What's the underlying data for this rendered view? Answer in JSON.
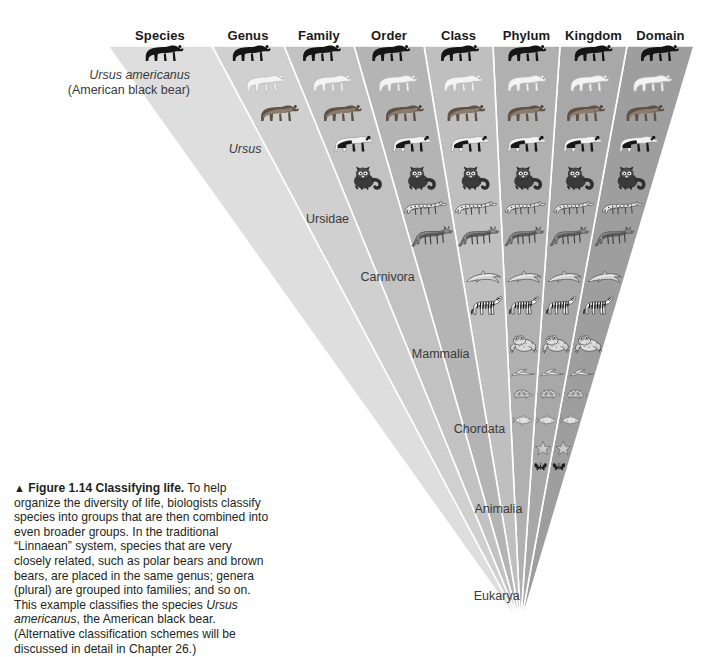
{
  "figure": {
    "marker": "▲",
    "number": "Figure 1.14",
    "title": "Classifying life.",
    "body_1": " To help organize the diversity of life, biologists classify species into groups that are then combined into even broader groups. In the traditional “Linnaean” system, species that are very closely related, such as polar bears and brown bears, are placed in the same genus; genera (plural) are grouped into families; and so on. This example classifies the species ",
    "body_italic": "Ursus americanus",
    "body_2": ", the American black bear. (Alternative classification schemes will be discussed in detail in Chapter 26.)"
  },
  "columns": [
    {
      "header": "Species",
      "rank_label": "Ursus americanus",
      "rank_sub": "(American black bear)",
      "italic": true,
      "shade": "#dedede"
    },
    {
      "header": "Genus",
      "rank_label": "Ursus",
      "italic": true,
      "shade": "#d0d0d0"
    },
    {
      "header": "Family",
      "rank_label": "Ursidae",
      "italic": false,
      "shade": "#c2c2c2"
    },
    {
      "header": "Order",
      "rank_label": "Carnivora",
      "italic": false,
      "shade": "#b4b4b4"
    },
    {
      "header": "Class",
      "rank_label": "Mammalia",
      "italic": false,
      "shade": "#bfbfbf"
    },
    {
      "header": "Phylum",
      "rank_label": "Chordata",
      "italic": false,
      "shade": "#b0b0b0"
    },
    {
      "header": "Kingdom",
      "rank_label": "Animalia",
      "italic": false,
      "shade": "#a8a8a8"
    },
    {
      "header": "Domain",
      "rank_label": "Eukarya",
      "italic": false,
      "shade": "#9e9e9e"
    }
  ],
  "organisms": [
    {
      "name": "black-bear",
      "first_col": 0
    },
    {
      "name": "polar-bear",
      "first_col": 1
    },
    {
      "name": "brown-bear",
      "first_col": 1
    },
    {
      "name": "panda",
      "first_col": 2
    },
    {
      "name": "red-panda",
      "first_col": 2
    },
    {
      "name": "leopard",
      "first_col": 3
    },
    {
      "name": "wolf",
      "first_col": 3
    },
    {
      "name": "dolphin",
      "first_col": 4
    },
    {
      "name": "zebra",
      "first_col": 4
    },
    {
      "name": "frog",
      "first_col": 5
    },
    {
      "name": "bird",
      "first_col": 5
    },
    {
      "name": "turtle",
      "first_col": 5
    },
    {
      "name": "fish",
      "first_col": 5
    },
    {
      "name": "starfish",
      "first_col": 6
    },
    {
      "name": "butterfly",
      "first_col": 6
    },
    {
      "name": "sponge",
      "first_col": 6
    },
    {
      "name": "flower",
      "first_col": 7
    },
    {
      "name": "mushroom",
      "first_col": 7
    },
    {
      "name": "amoeba",
      "first_col": 7
    }
  ],
  "colors": {
    "background": "#ffffff",
    "text": "#231f20",
    "label": "#3a3a3a",
    "separator": "#ffffff"
  }
}
